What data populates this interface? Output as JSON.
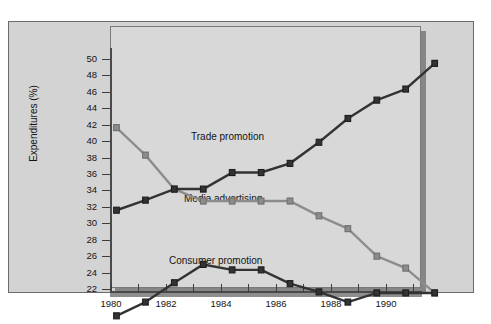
{
  "chart_data": {
    "type": "line",
    "title": "",
    "subtitle": "",
    "xlabel": "",
    "ylabel": "Expenditures (%)",
    "x": [
      1980,
      1981,
      1982,
      1983,
      1984,
      1985,
      1986,
      1987,
      1988,
      1989,
      1990,
      1991
    ],
    "xtick_labels": [
      "1980",
      "1982",
      "1984",
      "1986",
      "1988",
      "1990"
    ],
    "xtick_values": [
      1980,
      1982,
      1984,
      1986,
      1988,
      1990
    ],
    "xlim": [
      1980,
      1991
    ],
    "ytick_labels": [
      "22",
      "24",
      "26",
      "28",
      "30",
      "32",
      "34",
      "36",
      "38",
      "40",
      "42",
      "44",
      "46",
      "48",
      "50"
    ],
    "ytick_values": [
      22,
      24,
      26,
      28,
      30,
      32,
      34,
      36,
      38,
      40,
      42,
      44,
      46,
      48,
      50
    ],
    "ylim": [
      22,
      50
    ],
    "grid": false,
    "legend": "inline-annotations",
    "series": [
      {
        "name": "Trade promotion",
        "color": "#333333",
        "marker": "square",
        "label_position": "inline",
        "values": [
          34.0,
          35.1,
          36.3,
          36.3,
          38.1,
          38.1,
          39.1,
          41.4,
          44.0,
          46.0,
          47.2,
          50.0
        ]
      },
      {
        "name": "Media advertising",
        "color": "#8c8c8c",
        "marker": "square",
        "label_position": "inline",
        "values": [
          43.0,
          40.0,
          36.3,
          35.0,
          35.0,
          35.0,
          35.0,
          33.4,
          32.0,
          29.0,
          27.7,
          25.0
        ]
      },
      {
        "name": "Consumer promotion",
        "color": "#333333",
        "marker": "square",
        "label_position": "inline",
        "values": [
          22.5,
          24.0,
          26.1,
          28.1,
          27.5,
          27.5,
          26.0,
          25.1,
          24.0,
          25.0,
          25.0,
          25.0
        ]
      }
    ]
  },
  "colors": {
    "page_background": "#ffffff",
    "frame_background": "#d3d3d3",
    "plot_background": "#d8d8d8",
    "frame_border": "#6b6b6b",
    "axis": "#4a4a4a",
    "dark_series": "#333333",
    "light_series": "#8c8c8c",
    "text": "#141414"
  }
}
